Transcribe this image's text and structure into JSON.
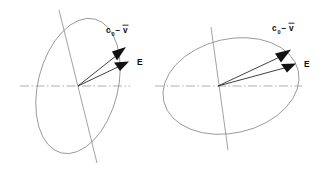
{
  "figure": {
    "background_color": "#ffffff",
    "ink_color": "#8a8a8a",
    "vector_color": "#121212",
    "panels": [
      {
        "id": "left-panel",
        "name": "narrow-tilted-ellipse-diagram",
        "ellipse": {
          "center_x": 78,
          "center_y": 86,
          "radius_x": 40,
          "radius_y": 69,
          "rotation_deg": 14
        },
        "horizontal_axis": {
          "x1": 20,
          "y1": 86,
          "x2": 130,
          "y2": 86,
          "style": "dash-dot"
        },
        "tilted_axis": {
          "x1": 59,
          "y1": 10,
          "x2": 97,
          "y2": 163,
          "style": "solid"
        },
        "vectors": [
          {
            "name": "c0-minus-v-vector",
            "label_main": "c",
            "label_sub": "0",
            "label_op": "−",
            "label_var": "v",
            "overbar": true,
            "from_x": 78,
            "from_y": 86,
            "to_x": 126,
            "to_y": 48,
            "label_x": 107,
            "label_y": 32
          },
          {
            "name": "E-vector",
            "label_main": "E",
            "from_x": 78,
            "from_y": 86,
            "to_x": 128,
            "to_y": 62,
            "label_x": 138,
            "label_y": 64
          }
        ]
      },
      {
        "id": "right-panel",
        "name": "wide-tilted-ellipse-diagram",
        "ellipse": {
          "center_x": 231,
          "center_y": 86,
          "radius_x": 69,
          "radius_y": 47,
          "rotation_deg": -13
        },
        "horizontal_axis": {
          "x1": 155,
          "y1": 86,
          "x2": 302,
          "y2": 86,
          "style": "dash-dot"
        },
        "tilted_axis": {
          "x1": 211,
          "y1": 27,
          "x2": 228,
          "y2": 150,
          "style": "solid"
        },
        "vectors": [
          {
            "name": "c0-minus-v-vector",
            "label_main": "c",
            "label_sub": "0",
            "label_op": "−",
            "label_var": "v",
            "overbar": true,
            "from_x": 218,
            "from_y": 86,
            "to_x": 290,
            "to_y": 50,
            "label_x": 273,
            "label_y": 30
          },
          {
            "name": "E-vector",
            "label_main": "E",
            "from_x": 218,
            "from_y": 86,
            "to_x": 295,
            "to_y": 64,
            "label_x": 305,
            "label_y": 66
          }
        ]
      }
    ]
  }
}
